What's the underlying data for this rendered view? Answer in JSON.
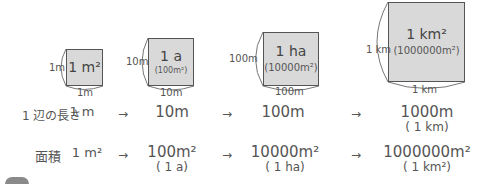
{
  "squares": [
    {
      "main": "1 m²",
      "sub": "",
      "side_left": "1m",
      "side_bottom": "1m"
    },
    {
      "main": "1 a",
      "sub": "(100m²)",
      "side_left": "10m",
      "side_bottom": "10m"
    },
    {
      "main": "1 ha",
      "sub": "(10000m²)",
      "side_left": "100m",
      "side_bottom": "100m"
    },
    {
      "main": "1 km²",
      "sub": "(1000000m²)",
      "side_left": "1 km",
      "side_bottom": "1 km"
    }
  ],
  "rows": {
    "side_length": {
      "label": "1 辺の長さ",
      "values": [
        {
          "v": "1 m",
          "p": ""
        },
        {
          "v": "10m",
          "p": ""
        },
        {
          "v": "100m",
          "p": ""
        },
        {
          "v": "1000m",
          "p": "( 1 km)"
        }
      ]
    },
    "area": {
      "label": "面積",
      "values": [
        {
          "v": "1 m²",
          "p": ""
        },
        {
          "v": "100m²",
          "p": "( 1 a)"
        },
        {
          "v": "10000m²",
          "p": "( 1 ha)"
        },
        {
          "v": "1000000m²",
          "p": "( 1 km²)"
        }
      ]
    },
    "arrow": "→"
  },
  "colors": {
    "square_fill": "#d9d9d9",
    "square_border": "#555555",
    "text": "#555555"
  }
}
